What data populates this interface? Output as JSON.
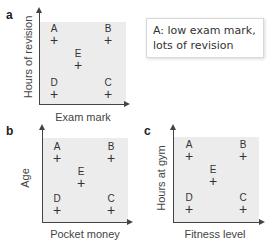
{
  "callout": {
    "line1": "A: low exam mark,",
    "line2": "lots of revision"
  },
  "panels": {
    "a": {
      "label": "a",
      "xlabel": "Exam mark",
      "ylabel": "Hours of revision"
    },
    "b": {
      "label": "b",
      "xlabel": "Pocket money",
      "ylabel": "Age"
    },
    "c": {
      "label": "c",
      "xlabel": "Fitness level",
      "ylabel": "Hours at gym"
    }
  },
  "points": {
    "A": "A",
    "B": "B",
    "C": "C",
    "D": "D",
    "E": "E"
  },
  "marker": "+",
  "colors": {
    "shade": "#ececec",
    "axis": "#444444"
  }
}
